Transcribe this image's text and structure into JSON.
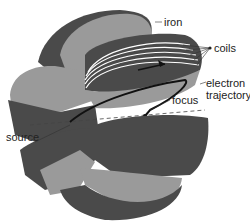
{
  "diagram": {
    "labels": {
      "iron": "iron",
      "coils": "coils",
      "electron_line1": "electron",
      "electron_line2": "trajectory",
      "focus": "focus",
      "source": "source"
    },
    "colors": {
      "dark_iron": "#4a4a4a",
      "light_iron": "#9a9a9a",
      "coil_lines": "#ffffff",
      "trajectory": "#111111",
      "background": "#ffffff"
    }
  }
}
